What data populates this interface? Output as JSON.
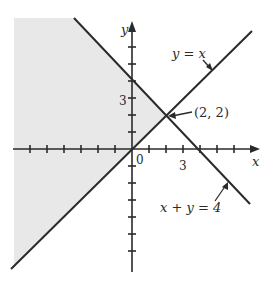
{
  "figure": {
    "type": "diagram",
    "axes": {
      "x_label": "x",
      "y_label": "y",
      "origin_label": "0",
      "x_tick_label": "3",
      "y_tick_label": "3",
      "unit_px": 17
    },
    "lines": [
      {
        "label": "y = x",
        "equation": "y = x"
      },
      {
        "label": "x + y = 4",
        "equation": "x + y = 4"
      }
    ],
    "intersection": {
      "label": "(2, 2)",
      "x": 2,
      "y": 2
    },
    "shaded_region": "x + y ≤ 4 and y ≥ x",
    "colors": {
      "line": "#2a2a2a",
      "shade": "#e6e6e6",
      "background": "#ffffff"
    }
  }
}
